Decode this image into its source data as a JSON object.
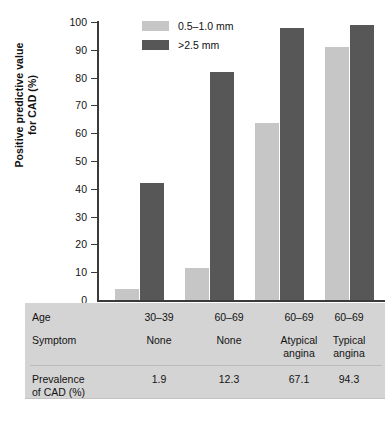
{
  "chart_data": {
    "type": "bar",
    "title": "",
    "xlabel": "",
    "ylabel": "Positive predictive value\nfor CAD (%)",
    "ylim": [
      0,
      100
    ],
    "yticks": [
      100,
      90,
      80,
      70,
      60,
      50,
      40,
      30,
      20,
      10,
      0
    ],
    "grid": false,
    "legend_position": "top-center",
    "categories": [
      "30–39 / None",
      "60–69 / None",
      "60–69 / Atypical angina",
      "60–69 / Typical angina"
    ],
    "series": [
      {
        "name": "0.5–1.0 mm",
        "color": "#c6c6c6",
        "values": [
          4,
          11.5,
          63.5,
          91
        ]
      },
      {
        "name": ">2.5 mm",
        "color": "#575757",
        "values": [
          42,
          82,
          98,
          99
        ]
      }
    ],
    "table": {
      "rows": [
        {
          "label": "Age",
          "values": [
            "30–39",
            "60–69",
            "60–69",
            "60–69"
          ]
        },
        {
          "label": "Symptom",
          "values": [
            "None",
            "None",
            "Atypical\nangina",
            "Typical\nangina"
          ]
        },
        {
          "label": "Prevalence\nof CAD (%)",
          "values": [
            "1.9",
            "12.3",
            "67.1",
            "94.3"
          ]
        }
      ]
    }
  },
  "axis": {
    "y_title_line1": "Positive predictive value",
    "y_title_line2": "for CAD (%)",
    "ticks": [
      "100",
      "90",
      "80",
      "70",
      "60",
      "50",
      "40",
      "30",
      "20",
      "10",
      "0"
    ]
  },
  "legend": {
    "items": [
      {
        "label": "0.5–1.0 mm"
      },
      {
        "label": ">2.5 mm"
      }
    ]
  },
  "table": {
    "row_age": {
      "label": "Age",
      "c1": "30–39",
      "c2": "60–69",
      "c3": "60–69",
      "c4": "60–69"
    },
    "row_symptom": {
      "label": "Symptom",
      "c1": "None",
      "c2": "None",
      "c3_line1": "Atypical",
      "c3_line2": "angina",
      "c4_line1": "Typical",
      "c4_line2": "angina"
    },
    "row_prevalence": {
      "label_line1": "Prevalence",
      "label_line2": "of CAD (%)",
      "c1": "1.9",
      "c2": "12.3",
      "c3": "67.1",
      "c4": "94.3"
    }
  }
}
